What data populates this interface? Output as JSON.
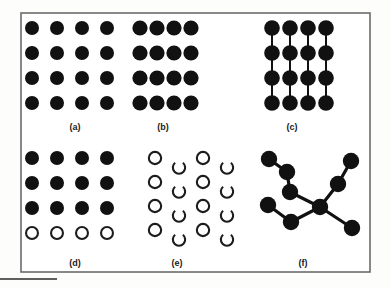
{
  "figure": {
    "canvas": {
      "width": 391,
      "height": 288
    },
    "background_color": "#fdfdfc",
    "frame": {
      "name": "figure-border",
      "x": 21,
      "y": 13,
      "width": 349,
      "height": 259,
      "stroke_color": "#6b6b6b",
      "stroke_width": 1.6,
      "fill": "#ffffff"
    },
    "caption_rule": {
      "name": "bottom-rule",
      "x1": 0,
      "y1": 279,
      "x2": 57,
      "y2": 279,
      "stroke_color": "#2a2a2a",
      "stroke_width": 1.6
    },
    "style": {
      "filled_color": "#111111",
      "outline_color": "#1c1c1c",
      "outline_stroke": 2.1,
      "bond_color": "#111111",
      "label_color": "#1a1a1a"
    },
    "panels": [
      {
        "id": "a",
        "label": "(a)",
        "label_x": 75,
        "label_y": 122,
        "description": "4 by 4 square array of separated filled circles",
        "type": "grid",
        "rows": 4,
        "cols": 4,
        "origin_x": 32,
        "origin_y": 28,
        "dx": 25,
        "dy": 25,
        "radius": 7.0,
        "fill_pattern": [
          [
            "filled",
            "filled",
            "filled",
            "filled"
          ],
          [
            "filled",
            "filled",
            "filled",
            "filled"
          ],
          [
            "filled",
            "filled",
            "filled",
            "filled"
          ],
          [
            "filled",
            "filled",
            "filled",
            "filled"
          ]
        ],
        "bonds": []
      },
      {
        "id": "b",
        "label": "(b)",
        "label_x": 163,
        "label_y": 122,
        "description": "4 by 4 array of filled circles touching along rows",
        "type": "grid",
        "rows": 4,
        "cols": 4,
        "origin_x": 140,
        "origin_y": 28,
        "dx": 17,
        "dy": 25,
        "radius": 7.6,
        "fill_pattern": [
          [
            "filled",
            "filled",
            "filled",
            "filled"
          ],
          [
            "filled",
            "filled",
            "filled",
            "filled"
          ],
          [
            "filled",
            "filled",
            "filled",
            "filled"
          ],
          [
            "filled",
            "filled",
            "filled",
            "filled"
          ]
        ],
        "bonds": []
      },
      {
        "id": "c",
        "label": "(c)",
        "label_x": 292,
        "label_y": 122,
        "description": "4 by 4 array of filled circles touching along rows and joined by vertical bonds",
        "type": "grid",
        "rows": 4,
        "cols": 4,
        "origin_x": 272,
        "origin_y": 28,
        "dx": 18,
        "dy": 25,
        "radius": 7.8,
        "fill_pattern": [
          [
            "filled",
            "filled",
            "filled",
            "filled"
          ],
          [
            "filled",
            "filled",
            "filled",
            "filled"
          ],
          [
            "filled",
            "filled",
            "filled",
            "filled"
          ],
          [
            "filled",
            "filled",
            "filled",
            "filled"
          ]
        ],
        "bonds": "vertical",
        "bond_width": 2.0
      },
      {
        "id": "d",
        "label": "(d)",
        "label_x": 75,
        "label_y": 258,
        "description": "4 by 4 array with three rows of filled circles above one row of open circles",
        "type": "grid",
        "rows": 4,
        "cols": 4,
        "origin_x": 32,
        "origin_y": 158,
        "dx": 25,
        "dy": 25,
        "radius": 7.0,
        "fill_pattern": [
          [
            "filled",
            "filled",
            "filled",
            "filled"
          ],
          [
            "filled",
            "filled",
            "filled",
            "filled"
          ],
          [
            "filled",
            "filled",
            "filled",
            "filled"
          ],
          [
            "open",
            "open",
            "open",
            "open"
          ]
        ],
        "bonds": []
      },
      {
        "id": "e",
        "label": "(e)",
        "label_x": 177,
        "label_y": 258,
        "description": "4 by 4 array alternating complete open rings and rings with a gap at the bottom",
        "type": "grid",
        "rows": 4,
        "cols": 4,
        "origin_x": 155,
        "origin_y": 158,
        "dx": 24,
        "dy": 24,
        "radius": 7.2,
        "fill_pattern": [
          [
            "open",
            "arc",
            "open",
            "arc"
          ],
          [
            "open",
            "arc",
            "open",
            "arc"
          ],
          [
            "open",
            "arc",
            "open",
            "arc"
          ],
          [
            "open",
            "arc",
            "open",
            "arc"
          ]
        ],
        "arc_gap_degrees": 78,
        "arc_gap_center_degrees": 90,
        "bonds": []
      },
      {
        "id": "f",
        "label": "(f)",
        "label_x": 303,
        "label_y": 258,
        "description": "Branched network of filled circles joined by bonds",
        "type": "network",
        "radius": 8.2,
        "bond_width": 3.2,
        "nodes": [
          {
            "name": "node-top-left",
            "x": 269,
            "y": 159
          },
          {
            "name": "node-upper-chain",
            "x": 287,
            "y": 172
          },
          {
            "name": "node-mid-chain",
            "x": 290,
            "y": 192
          },
          {
            "name": "node-center-hub",
            "x": 320,
            "y": 207
          },
          {
            "name": "node-left",
            "x": 268,
            "y": 205
          },
          {
            "name": "node-lower-left",
            "x": 291,
            "y": 222
          },
          {
            "name": "node-lower-right",
            "x": 352,
            "y": 228
          },
          {
            "name": "node-right-chain",
            "x": 338,
            "y": 184
          },
          {
            "name": "node-top-right",
            "x": 351,
            "y": 161
          }
        ],
        "bonds_list": [
          [
            0,
            1
          ],
          [
            1,
            2
          ],
          [
            2,
            3
          ],
          [
            4,
            5
          ],
          [
            5,
            3
          ],
          [
            3,
            6
          ],
          [
            3,
            7
          ],
          [
            7,
            8
          ]
        ]
      }
    ]
  }
}
